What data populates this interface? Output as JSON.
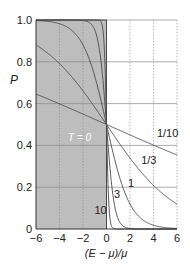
{
  "chart_data": {
    "type": "line",
    "title": "",
    "xlabel": "(E − μ)/μ",
    "ylabel": "P",
    "xlim": [
      -6,
      6
    ],
    "ylim": [
      0,
      1.0
    ],
    "xticks": [
      -6,
      -4,
      -2,
      0,
      2,
      4,
      6
    ],
    "xtick_labels": [
      "−6",
      "−4",
      "−2",
      "0",
      "2",
      "4",
      "6"
    ],
    "yticks": [
      0,
      0.2,
      0.4,
      0.6,
      0.8,
      1.0
    ],
    "ytick_labels": [
      "0",
      "0.2",
      "0.4",
      "0.6",
      "0.8",
      "1.0"
    ],
    "grid": true,
    "shaded_region": {
      "x_from": -6,
      "x_to": 0,
      "label": "T = 0",
      "color": "#bdbdbd"
    },
    "series": [
      {
        "name": "1/10",
        "scale": 10,
        "points": [
          [
            -6,
            0.65
          ],
          [
            -4,
            0.6
          ],
          [
            -2,
            0.55
          ],
          [
            0,
            0.5
          ],
          [
            2,
            0.45
          ],
          [
            4,
            0.4
          ],
          [
            6,
            0.35
          ]
        ]
      },
      {
        "name": "1/3",
        "scale": 3,
        "points": [
          [
            -6,
            0.88
          ],
          [
            -4,
            0.79
          ],
          [
            -2,
            0.66
          ],
          [
            0,
            0.5
          ],
          [
            2,
            0.34
          ],
          [
            4,
            0.21
          ],
          [
            6,
            0.12
          ]
        ]
      },
      {
        "name": "1",
        "scale": 1,
        "points": [
          [
            -6,
            0.998
          ],
          [
            -4,
            0.98
          ],
          [
            -2,
            0.88
          ],
          [
            0,
            0.5
          ],
          [
            2,
            0.12
          ],
          [
            4,
            0.02
          ],
          [
            6,
            0.002
          ]
        ]
      },
      {
        "name": "3",
        "scale": 0.333,
        "points": [
          [
            -6,
            1.0
          ],
          [
            -4,
            1.0
          ],
          [
            -2,
            0.998
          ],
          [
            0,
            0.5
          ],
          [
            2,
            0.002
          ],
          [
            4,
            0.0
          ],
          [
            6,
            0.0
          ]
        ]
      },
      {
        "name": "10",
        "scale": 0.1,
        "points": [
          [
            -6,
            1.0
          ],
          [
            -2,
            1.0
          ],
          [
            0,
            0.5
          ],
          [
            2,
            0.0
          ],
          [
            6,
            0.0
          ]
        ]
      }
    ],
    "curve_labels": [
      {
        "text": "1/10",
        "x": 5.2,
        "y": 0.44
      },
      {
        "text": "1/3",
        "x": 3.6,
        "y": 0.31
      },
      {
        "text": "1",
        "x": 2.1,
        "y": 0.2
      },
      {
        "text": "3",
        "x": 0.9,
        "y": 0.15
      },
      {
        "text": "10",
        "x": -0.5,
        "y": 0.07
      }
    ],
    "colors": {
      "curve": "#4a4a4a",
      "shade": "#bdbdbd",
      "grid": "#8a8a8a",
      "t0_label": "#ffffff"
    }
  }
}
